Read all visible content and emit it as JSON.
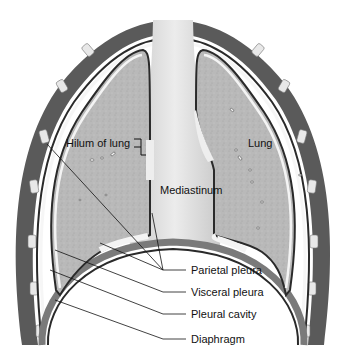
{
  "figure": {
    "labels": {
      "hilum": "Hilum of lung",
      "lung": "Lung",
      "mediastinum": "Mediastinum",
      "parietal_pleura": "Parietal pleura",
      "visceral_pleura": "Visceral pleura",
      "pleural_cavity": "Pleural cavity",
      "diaphragm": "Diaphragm"
    },
    "colors": {
      "lung_fill": "#b9b9b9",
      "mediastinum_fill": "#e2e2e2",
      "pleura_dark": "#2a2a2a",
      "rib_fill": "#e8e8e8",
      "chest_wall": "#5a5a5a",
      "background": "#ffffff"
    }
  }
}
